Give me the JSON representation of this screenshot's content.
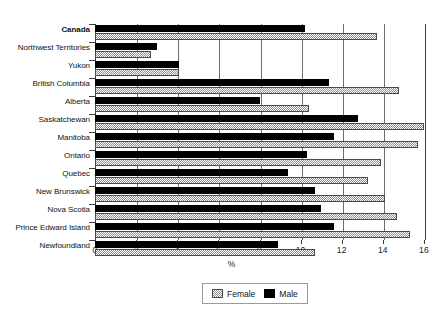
{
  "chart_data": {
    "type": "bar",
    "orientation": "horizontal",
    "title": "",
    "xlabel": "%",
    "ylabel": "",
    "xlim": [
      0,
      16
    ],
    "xticks": [
      0,
      2,
      4,
      6,
      8,
      10,
      12,
      14,
      16
    ],
    "xtick_labels": [
      "0",
      "2",
      "4",
      "6",
      "8",
      "10",
      "12",
      "14",
      "16"
    ],
    "grid": true,
    "grid_axis": "x",
    "legend_position": "bottom-center",
    "categories": [
      "Canada",
      "Northwest Territories",
      "Yukon",
      "British Columbia",
      "Alberta",
      "Saskatchewan",
      "Manitoba",
      "Ontario",
      "Quebec",
      "New Brunswick",
      "Nova Scotia",
      "Prince Edward Island",
      "Newfoundland"
    ],
    "emphasized_categories": [
      "Canada"
    ],
    "series": [
      {
        "name": "Female",
        "color": "#8e8e8e",
        "pattern": "checkered",
        "values": [
          13.7,
          2.7,
          4.1,
          14.8,
          10.4,
          16.0,
          15.7,
          13.9,
          13.3,
          14.1,
          14.7,
          15.3,
          10.7
        ]
      },
      {
        "name": "Male",
        "color": "#000000",
        "pattern": "solid",
        "values": [
          10.2,
          3.0,
          4.1,
          11.4,
          8.0,
          12.8,
          11.6,
          10.3,
          9.4,
          10.7,
          11.0,
          11.6,
          8.9
        ]
      }
    ]
  },
  "legend": {
    "items": [
      {
        "label": "Female"
      },
      {
        "label": "Male"
      }
    ]
  }
}
